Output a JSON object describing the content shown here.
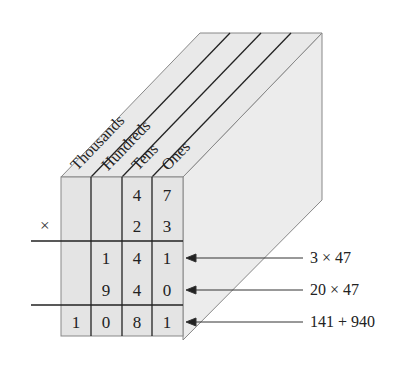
{
  "diagram": {
    "title": "",
    "column_labels": [
      "Thousands",
      "Hundreds",
      "Tens",
      "Ones"
    ],
    "operator": "×",
    "rows": [
      {
        "name": "multiplicand",
        "cells": [
          "",
          "",
          "4",
          "7"
        ]
      },
      {
        "name": "multiplier",
        "cells": [
          "",
          "",
          "2",
          "3"
        ]
      },
      {
        "name": "partial-1",
        "cells": [
          "",
          "1",
          "4",
          "1"
        ]
      },
      {
        "name": "partial-2",
        "cells": [
          "",
          "9",
          "4",
          "0"
        ]
      },
      {
        "name": "product",
        "cells": [
          "1",
          "0",
          "8",
          "1"
        ]
      }
    ],
    "annotations": [
      {
        "text": "3 × 47",
        "points_to": "partial-1"
      },
      {
        "text": "20 × 47",
        "points_to": "partial-2"
      },
      {
        "text": "141 + 940",
        "points_to": "product"
      }
    ],
    "colors": {
      "box_fill": "#e6e6e6",
      "side_fill": "#ececec",
      "line": "#222222",
      "edge": "#777777"
    }
  }
}
